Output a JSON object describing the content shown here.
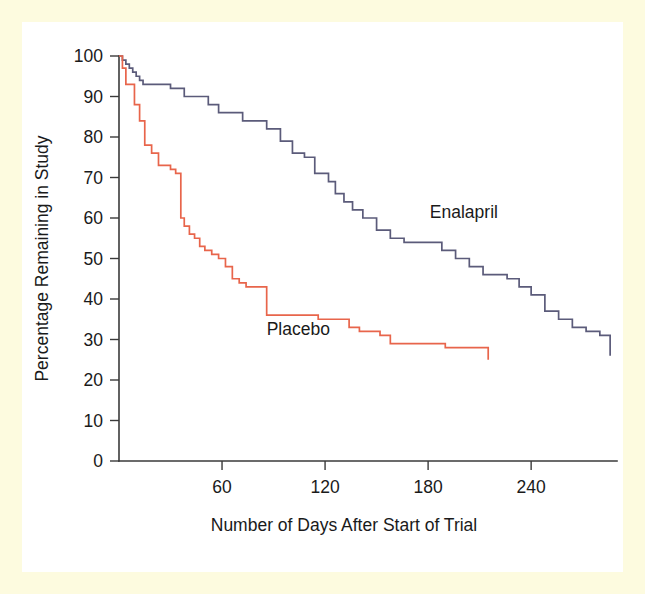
{
  "figure": {
    "frame_color": "#fdfbdf",
    "plate_color": "#ffffff",
    "axis_color": "#3a3a3a"
  },
  "chart_data": {
    "type": "line",
    "title": "",
    "subtitle": "",
    "xlabel": "Number of Days After Start of Trial",
    "ylabel": "Percentage Remaining in Study",
    "xlim": [
      0,
      290
    ],
    "ylim": [
      0,
      100
    ],
    "xticks": [
      60,
      120,
      180,
      240
    ],
    "xtick_labels": [
      "60",
      "120",
      "180",
      "240"
    ],
    "yticks": [
      0,
      10,
      20,
      30,
      40,
      50,
      60,
      70,
      80,
      90,
      100
    ],
    "ytick_labels": [
      "0",
      "10",
      "20",
      "30",
      "40",
      "50",
      "60",
      "70",
      "80",
      "90",
      "100"
    ],
    "grid": false,
    "legend_position": "inline-annotation",
    "step_style": "post",
    "series": [
      {
        "name": "Enalapril",
        "color": "#5b5b7a",
        "label_x_value": 181,
        "label_y_value": 60,
        "x": [
          0,
          2,
          4,
          6,
          8,
          10,
          12,
          14,
          16,
          18,
          21,
          24,
          30,
          38,
          44,
          52,
          58,
          66,
          72,
          80,
          86,
          94,
          101,
          108,
          114,
          118,
          122,
          126,
          131,
          136,
          142,
          150,
          158,
          166,
          174,
          181,
          188,
          196,
          204,
          212,
          219,
          226,
          233,
          240,
          248,
          256,
          264,
          272,
          280,
          286
        ],
        "y": [
          100,
          99,
          98,
          97,
          96,
          95,
          94,
          93,
          93,
          93,
          93,
          93,
          92,
          90,
          90,
          88,
          86,
          86,
          84,
          84,
          82,
          79,
          76,
          75,
          71,
          71,
          69,
          66,
          64,
          62,
          60,
          57,
          55,
          54,
          54,
          54,
          52,
          50,
          48,
          46,
          46,
          45,
          43,
          41,
          37,
          35,
          33,
          32,
          31,
          26
        ]
      },
      {
        "name": "Placebo",
        "color": "#e8654b",
        "label_x_value": 86,
        "label_y_value": 31,
        "x": [
          0,
          2,
          4,
          6,
          9,
          12,
          15,
          19,
          23,
          27,
          30,
          33,
          36,
          38,
          41,
          44,
          47,
          50,
          54,
          58,
          62,
          66,
          70,
          74,
          78,
          82,
          86,
          92,
          98,
          104,
          110,
          116,
          122,
          128,
          134,
          140,
          146,
          152,
          158,
          165,
          172,
          180,
          190,
          200,
          210,
          215
        ],
        "y": [
          100,
          97,
          93,
          93,
          88,
          84,
          78,
          76,
          73,
          73,
          72,
          71,
          60,
          58,
          56,
          55,
          53,
          52,
          51,
          50,
          48,
          45,
          44,
          43,
          43,
          43,
          36,
          36,
          36,
          36,
          36,
          35,
          35,
          35,
          33,
          32,
          32,
          31,
          29,
          29,
          29,
          29,
          28,
          28,
          28,
          25
        ]
      }
    ]
  }
}
